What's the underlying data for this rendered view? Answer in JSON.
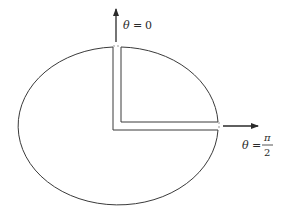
{
  "diagram": {
    "labels": {
      "theta_zero": {
        "symbol": "θ",
        "equals": "=",
        "value": "0"
      },
      "theta_half_pi": {
        "symbol": "θ",
        "equals": "=",
        "numerator": "π",
        "denominator": "2"
      }
    },
    "colors": {
      "stroke": "#3a3a3a",
      "background": "#ffffff"
    }
  }
}
